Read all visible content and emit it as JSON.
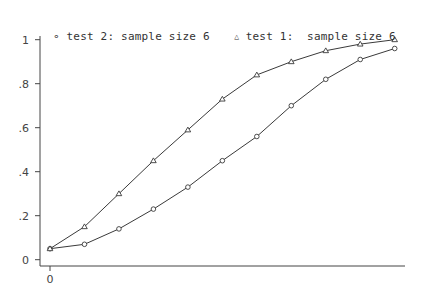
{
  "legend": [
    {
      "marker": "circle",
      "label": "test 2: sample size 6"
    },
    {
      "marker": "triangle",
      "label": "test 1:  sample size 6"
    }
  ],
  "axes": {
    "y_ticks": [
      {
        "value": 1,
        "label": "1"
      },
      {
        "value": 0.8,
        "label": ".8"
      },
      {
        "value": 0.6,
        "label": ".6"
      },
      {
        "value": 0.4,
        "label": ".4"
      },
      {
        "value": 0.2,
        "label": ".2"
      },
      {
        "value": 0,
        "label": "0"
      }
    ],
    "x_ticks": [
      {
        "value": 0,
        "label": "0"
      }
    ]
  },
  "colors": {
    "line": "#3a3a3a",
    "axis": "#444444",
    "background": "#ffffff"
  },
  "chart_data": {
    "type": "line",
    "title": "",
    "xlabel": "",
    "ylabel": "",
    "x": [
      0,
      1,
      2,
      3,
      4,
      5,
      6,
      7,
      8,
      9,
      10
    ],
    "series": [
      {
        "name": "test 2: sample size 6",
        "marker": "circle",
        "values": [
          0.05,
          0.07,
          0.14,
          0.23,
          0.33,
          0.45,
          0.56,
          0.7,
          0.82,
          0.91,
          0.96
        ]
      },
      {
        "name": "test 1:  sample size 6",
        "marker": "triangle",
        "values": [
          0.05,
          0.15,
          0.3,
          0.45,
          0.59,
          0.73,
          0.84,
          0.9,
          0.95,
          0.98,
          1.0
        ]
      }
    ],
    "ylim": [
      0,
      1
    ],
    "xlim": [
      -0.25,
      10.3
    ],
    "x_tick_labels": [
      "0"
    ],
    "y_tick_labels": [
      "0",
      ".2",
      ".4",
      ".6",
      ".8",
      "1"
    ],
    "grid": false,
    "legend_position": "top"
  }
}
